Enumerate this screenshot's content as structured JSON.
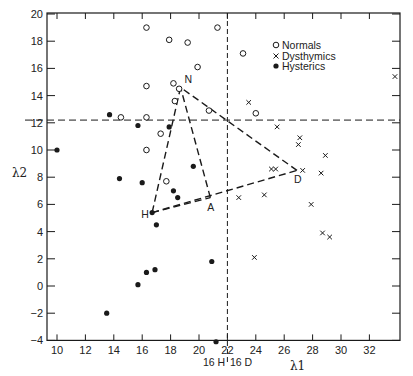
{
  "chart_data": {
    "type": "scatter",
    "title": "",
    "xlabel": "λ1",
    "ylabel": "λ2",
    "xlim": [
      9,
      34.3
    ],
    "ylim": [
      -4,
      20
    ],
    "x_ticks": [
      10,
      12,
      14,
      16,
      18,
      20,
      22,
      24,
      26,
      28,
      30,
      32
    ],
    "y_ticks": [
      -4,
      -2,
      0,
      2,
      4,
      6,
      8,
      10,
      12,
      14,
      16,
      18,
      20
    ],
    "grid": false,
    "legend_position": "upper right",
    "legend": [
      {
        "name": "Normals",
        "marker": "open-circle"
      },
      {
        "name": "Dysthymics",
        "marker": "cross"
      },
      {
        "name": "Hysterics",
        "marker": "filled-circle"
      }
    ],
    "series": [
      {
        "name": "Normals",
        "marker": "open-circle",
        "points": [
          [
            16.3,
            19.0
          ],
          [
            21.3,
            19.0
          ],
          [
            17.9,
            18.1
          ],
          [
            19.2,
            17.9
          ],
          [
            19.9,
            16.1
          ],
          [
            16.3,
            14.7
          ],
          [
            18.2,
            14.9
          ],
          [
            18.6,
            14.5
          ],
          [
            18.3,
            13.6
          ],
          [
            20.7,
            12.9
          ],
          [
            14.5,
            12.4
          ],
          [
            16.3,
            12.4
          ],
          [
            17.3,
            11.2
          ],
          [
            16.3,
            10.0
          ],
          [
            17.7,
            7.7
          ],
          [
            23.1,
            17.1
          ],
          [
            24.0,
            12.7
          ]
        ]
      },
      {
        "name": "Dysthymics",
        "marker": "cross",
        "points": [
          [
            23.5,
            13.5
          ],
          [
            25.5,
            11.7
          ],
          [
            27.1,
            10.9
          ],
          [
            27.0,
            10.4
          ],
          [
            28.9,
            9.6
          ],
          [
            25.1,
            8.6
          ],
          [
            25.4,
            8.6
          ],
          [
            27.3,
            8.5
          ],
          [
            28.6,
            8.3
          ],
          [
            24.6,
            6.7
          ],
          [
            22.8,
            6.5
          ],
          [
            27.9,
            6.0
          ],
          [
            28.7,
            3.9
          ],
          [
            29.2,
            3.6
          ],
          [
            23.9,
            2.1
          ],
          [
            33.8,
            15.4
          ]
        ]
      },
      {
        "name": "Hysterics",
        "marker": "filled-circle",
        "points": [
          [
            10.0,
            10.0
          ],
          [
            13.7,
            12.6
          ],
          [
            15.7,
            11.8
          ],
          [
            17.9,
            11.7
          ],
          [
            14.4,
            7.9
          ],
          [
            16.0,
            7.6
          ],
          [
            19.6,
            8.8
          ],
          [
            18.2,
            7.0
          ],
          [
            18.5,
            6.5
          ],
          [
            16.7,
            5.4
          ],
          [
            17.0,
            4.5
          ],
          [
            20.9,
            1.8
          ],
          [
            16.9,
            1.2
          ],
          [
            16.3,
            1.0
          ],
          [
            15.7,
            0.1
          ],
          [
            13.5,
            -2.0
          ],
          [
            21.2,
            -4.1
          ]
        ]
      }
    ],
    "centroids": [
      {
        "label": "N",
        "x": 18.7,
        "y": 14.6
      },
      {
        "label": "H",
        "x": 16.7,
        "y": 5.4
      },
      {
        "label": "A",
        "x": 20.8,
        "y": 6.5
      },
      {
        "label": "D",
        "x": 26.9,
        "y": 8.5
      }
    ],
    "triangles": [
      [
        "N",
        "H",
        "A"
      ],
      [
        "N",
        "H",
        "D"
      ]
    ],
    "reference_lines": [
      {
        "orientation": "vertical",
        "value": 22,
        "style": "dashed"
      },
      {
        "orientation": "horizontal",
        "value": 12.2,
        "style": "dashed"
      }
    ],
    "annotations": [
      {
        "text": "16 H",
        "near_x": 22,
        "position": "below axis, left of dashed line"
      },
      {
        "text": "16 D",
        "near_x": 22,
        "position": "below axis, right of dashed line"
      }
    ]
  },
  "labels": {
    "xlabel": "λ1",
    "ylabel": "λ2",
    "legend_normals": "Normals",
    "legend_dysthymics": "Dysthymics",
    "legend_hysterics": "Hysterics",
    "below_left": "16 H",
    "below_right": "16 D",
    "vertex_n": "N",
    "vertex_h": "H",
    "vertex_a": "A",
    "vertex_d": "D"
  },
  "colors": {
    "ink": "#1a1a1a",
    "background": "#ffffff"
  }
}
